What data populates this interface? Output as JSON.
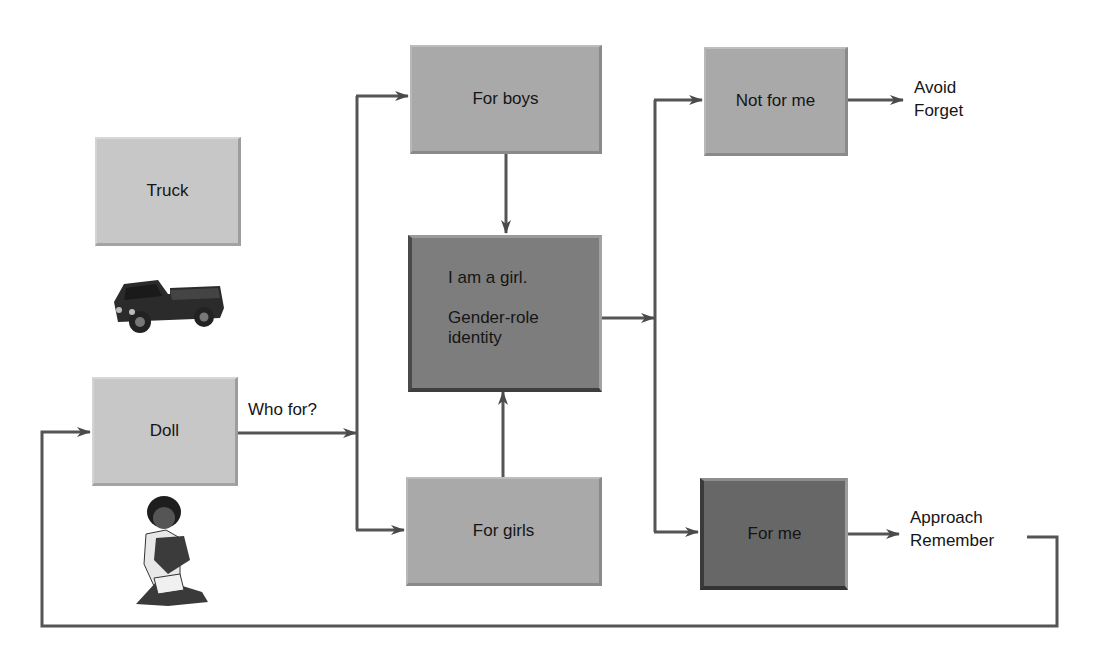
{
  "diagram": {
    "nodes": {
      "truck": {
        "label": "Truck"
      },
      "doll": {
        "label": "Doll"
      },
      "for_boys": {
        "label": "For boys"
      },
      "identity": {
        "line1": "I am a girl.",
        "line2a": "Gender-role",
        "line2b": "identity"
      },
      "for_girls": {
        "label": "For girls"
      },
      "not_for_me": {
        "label": "Not for me"
      },
      "for_me": {
        "label": "For me"
      }
    },
    "edge_labels": {
      "who_for": "Who for?"
    },
    "outcomes": {
      "negative": {
        "line1": "Avoid",
        "line2": "Forget"
      },
      "positive": {
        "line1": "Approach",
        "line2": "Remember"
      }
    },
    "images": {
      "truck": "toy-truck-illustration",
      "girl": "girl-hugging-doll-illustration"
    },
    "colors": {
      "line": "#4a4a4a",
      "light_box": "#c7c7c7",
      "mid_box": "#a9a9a9",
      "dark_box": "#7d7d7d",
      "darker_box": "#676767"
    }
  }
}
